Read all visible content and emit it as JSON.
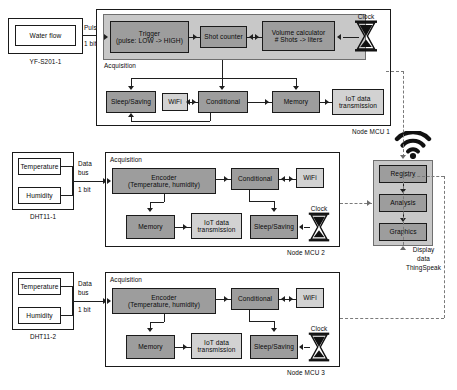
{
  "diagram": {
    "colors": {
      "process_block": "#9d9d9d",
      "io_block": "#d2d2d2",
      "acquisition_band": "#c8c8c8",
      "line": "#1f1f1f",
      "dashed_line": "#7a7a7a"
    }
  },
  "sensors": [
    {
      "id": "yf-s201-1",
      "label": "YF-S201-1",
      "inputs": [
        "Water flow"
      ],
      "bus_label_line1": "Pulse",
      "bus_label_line2": "1 bit"
    },
    {
      "id": "dht11-1",
      "label": "DHT11-1",
      "inputs": [
        "Temperature",
        "Humidity"
      ],
      "bus_label_line1": "Data",
      "bus_label_line2": "bus",
      "bus_label_line3": "1 bit"
    },
    {
      "id": "dht11-2",
      "label": "DHT11-2",
      "inputs": [
        "Temperature",
        "Humidity"
      ],
      "bus_label_line1": "Data",
      "bus_label_line2": "bus",
      "bus_label_line3": "1 bit"
    }
  ],
  "nodes": [
    {
      "id": "node-mcu-1",
      "label": "Node MCU 1",
      "acquisition_label": "Acquisition",
      "clock_label": "Clock",
      "acquisition_blocks": [
        {
          "id": "trigger",
          "line1": "Trigger",
          "line2": "(pulse: LOW -> HIGH)"
        },
        {
          "id": "shot-counter",
          "line1": "Shot counter",
          "line2": ""
        },
        {
          "id": "volume-calculator",
          "line1": "Volume calculator",
          "line2": "# Shots -> liters"
        }
      ],
      "blocks": [
        {
          "id": "sleep-saving",
          "line1": "Sleep/Saving",
          "line2": ""
        },
        {
          "id": "wifi",
          "line1": "WiFi",
          "line2": ""
        },
        {
          "id": "conditional",
          "line1": "Conditional",
          "line2": ""
        },
        {
          "id": "memory",
          "line1": "Memory",
          "line2": ""
        },
        {
          "id": "iot-data-transmission",
          "line1": "IoT data",
          "line2": "transmission"
        }
      ]
    },
    {
      "id": "node-mcu-2",
      "label": "Node MCU 2",
      "acquisition_label": "Acquisition",
      "clock_label": "Clock",
      "blocks": [
        {
          "id": "encoder",
          "line1": "Encoder",
          "line2": "(Temperature, humidity)"
        },
        {
          "id": "conditional",
          "line1": "Conditional",
          "line2": ""
        },
        {
          "id": "wifi",
          "line1": "WiFi",
          "line2": ""
        },
        {
          "id": "memory",
          "line1": "Memory",
          "line2": ""
        },
        {
          "id": "iot-data-transmission",
          "line1": "IoT data",
          "line2": "transmission"
        },
        {
          "id": "sleep-saving",
          "line1": "Sleep/Saving",
          "line2": ""
        }
      ]
    },
    {
      "id": "node-mcu-3",
      "label": "Node MCU 3",
      "acquisition_label": "Acquisition",
      "clock_label": "Clock",
      "blocks": [
        {
          "id": "encoder",
          "line1": "Encoder",
          "line2": "(Temperature, humidity)"
        },
        {
          "id": "conditional",
          "line1": "Conditional",
          "line2": ""
        },
        {
          "id": "wifi",
          "line1": "WiFi",
          "line2": ""
        },
        {
          "id": "memory",
          "line1": "Memory",
          "line2": ""
        },
        {
          "id": "iot-data-transmission",
          "line1": "IoT data",
          "line2": "transmission"
        },
        {
          "id": "sleep-saving",
          "line1": "Sleep/Saving",
          "line2": ""
        }
      ]
    }
  ],
  "cloud": {
    "id": "thingspeak",
    "blocks": [
      {
        "id": "registry",
        "label": "Registry"
      },
      {
        "id": "analysis",
        "label": "Analysis"
      },
      {
        "id": "graphics",
        "label": "Graphics"
      }
    ],
    "caption_line1": "Display",
    "caption_line2": "data",
    "caption_line3": "ThingSpeak"
  }
}
